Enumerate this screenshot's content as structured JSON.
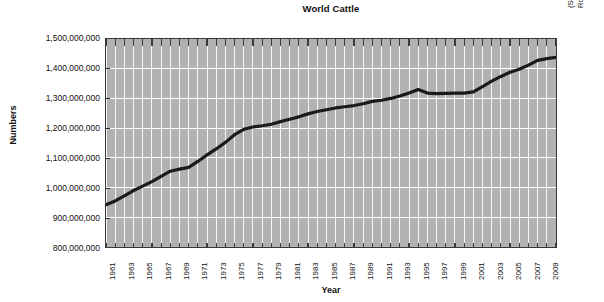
{
  "chart_data": {
    "type": "line",
    "title": "World Cattle",
    "xlabel": "Year",
    "ylabel": "Numbers",
    "grid": true,
    "legend": null,
    "xlim": [
      1961,
      2010
    ],
    "ylim": [
      800000000,
      1500000000
    ],
    "y_ticks": [
      "800,000,000",
      "900,000,000",
      "1,000,000,000",
      "1,100,000,000",
      "1,200,000,000",
      "1,300,000,000",
      "1,400,000,000",
      "1,500,000,000"
    ],
    "y_tick_values": [
      800000000,
      900000000,
      1000000000,
      1100000000,
      1200000000,
      1300000000,
      1400000000,
      1500000000
    ],
    "x_tick_labels": [
      "1961",
      "1963",
      "1965",
      "1967",
      "1969",
      "1971",
      "1973",
      "1975",
      "1977",
      "1979",
      "1981",
      "1983",
      "1985",
      "1987",
      "1989",
      "1991",
      "1993",
      "1995",
      "1997",
      "1999",
      "2001",
      "2003",
      "2005",
      "2007",
      "2009"
    ],
    "x": [
      1961,
      1962,
      1963,
      1964,
      1965,
      1966,
      1967,
      1968,
      1969,
      1970,
      1971,
      1972,
      1973,
      1974,
      1975,
      1976,
      1977,
      1978,
      1979,
      1980,
      1981,
      1982,
      1983,
      1984,
      1985,
      1986,
      1987,
      1988,
      1989,
      1990,
      1991,
      1992,
      1993,
      1994,
      1995,
      1996,
      1997,
      1998,
      1999,
      2000,
      2001,
      2002,
      2003,
      2004,
      2005,
      2006,
      2007,
      2008,
      2009,
      2010
    ],
    "series": [
      {
        "name": "World cattle numbers",
        "color": "#1a1a1a",
        "values": [
          942000000,
          955000000,
          972000000,
          990000000,
          1005000000,
          1020000000,
          1038000000,
          1055000000,
          1062000000,
          1068000000,
          1088000000,
          1110000000,
          1130000000,
          1152000000,
          1178000000,
          1196000000,
          1204000000,
          1208000000,
          1213000000,
          1222000000,
          1230000000,
          1238000000,
          1248000000,
          1256000000,
          1262000000,
          1268000000,
          1272000000,
          1276000000,
          1282000000,
          1290000000,
          1294000000,
          1300000000,
          1308000000,
          1318000000,
          1330000000,
          1318000000,
          1316000000,
          1317000000,
          1318000000,
          1318000000,
          1322000000,
          1340000000,
          1358000000,
          1374000000,
          1388000000,
          1398000000,
          1412000000,
          1428000000,
          1434000000,
          1438000000
        ]
      }
    ],
    "source_note": "(Source: Data from UN Food and Agriculture Organization statistics, \"Live Animals,\" Rome, Italy.)"
  }
}
